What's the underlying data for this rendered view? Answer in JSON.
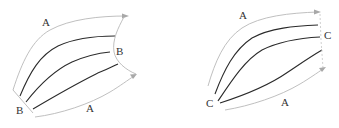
{
  "figure": {
    "panels": [
      {
        "id": "left",
        "labels": {
          "top_flow": "A",
          "right_boundary": "B",
          "left_corner": "B",
          "bottom_flow": "A"
        }
      },
      {
        "id": "right",
        "labels": {
          "top_flow": "A",
          "right_boundary": "C",
          "left_corner": "C",
          "bottom_flow": "A"
        }
      }
    ]
  },
  "colors": {
    "boundary": "#b8b8b8",
    "streamline": "#2a2a2a",
    "label": "#333333"
  }
}
